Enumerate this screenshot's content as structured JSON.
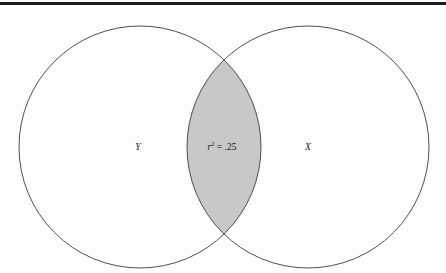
{
  "figure": {
    "background_color": "#fdfdfd",
    "width": 446,
    "height": 273
  },
  "top_rule": {
    "color": "#1d1d1d",
    "thickness": 3
  },
  "venn": {
    "stroke_color": "#3b3b3b",
    "stroke_width": 0.9,
    "circle_fill": "#fdfdfd",
    "intersection_fill": "#c8c8c8",
    "left_circle": {
      "label": "Y",
      "center_x": 140,
      "center_y": 147,
      "radius": 121,
      "label_x": 138,
      "label_y": 148
    },
    "right_circle": {
      "label": "X",
      "center_x": 308,
      "center_y": 147,
      "radius": 121,
      "label_x": 308,
      "label_y": 148
    },
    "intersection": {
      "label_variable": "r",
      "label_exponent": "2",
      "label_rest": " = .25",
      "label_x": 222,
      "label_y": 148,
      "top_crossing_x": 222,
      "top_crossing_y": 66,
      "bottom_crossing_x": 222,
      "bottom_crossing_y": 228
    }
  }
}
